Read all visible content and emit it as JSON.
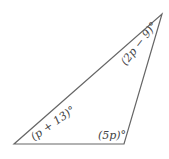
{
  "diagram": {
    "type": "triangle",
    "vertices": [
      [
        14,
        144
      ],
      [
        124,
        144
      ],
      [
        162,
        14
      ]
    ],
    "line_color": "#666666",
    "angles": [
      {
        "vertex": "bottom-left",
        "label": "(p + 13)°"
      },
      {
        "vertex": "bottom-right",
        "label": "(5p)°"
      },
      {
        "vertex": "top-right",
        "label": "(2p − 9)°"
      }
    ]
  }
}
